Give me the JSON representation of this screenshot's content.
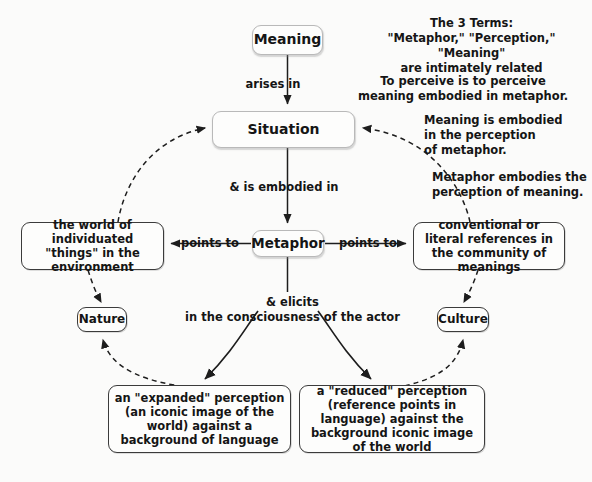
{
  "diagram": {
    "background_color": "#fbfbfa",
    "node_border_color": "#3b3b3b",
    "text_color": "#151515"
  },
  "nodes": {
    "meaning": "Meaning",
    "situation": "Situation",
    "metaphor": "Metaphor",
    "nature": "Nature",
    "culture": "Culture",
    "world": "the world of\nindividuated \"things\"\nin the environment",
    "conventional": "conventional or literal\nreferences in the\ncommunity of meanings",
    "expanded": "an \"expanded\" perception\n(an iconic image of the world)\nagainst a background of\nlanguage",
    "reduced": "a \"reduced\" perception\n(reference points in language)\nagainst the background iconic\nimage of the world"
  },
  "edge_labels": {
    "arises_in": "arises in",
    "is_embodied_in": "& is embodied in",
    "points_to_left": "points to",
    "points_to_right": "points to",
    "elicits": "& elicits\nin the consciousness of the actor"
  },
  "annotations": {
    "three_terms": "The 3 Terms:\n\"Metaphor,\" \"Perception,\" \"Meaning\"\nare intimately related",
    "to_perceive": "To perceive is to perceive\nmeaning embodied in metaphor.",
    "meaning_embodied": "Meaning is embodied\nin the perception\nof metaphor.",
    "metaphor_embodies": "Metaphor embodies the\nperception of meaning."
  }
}
